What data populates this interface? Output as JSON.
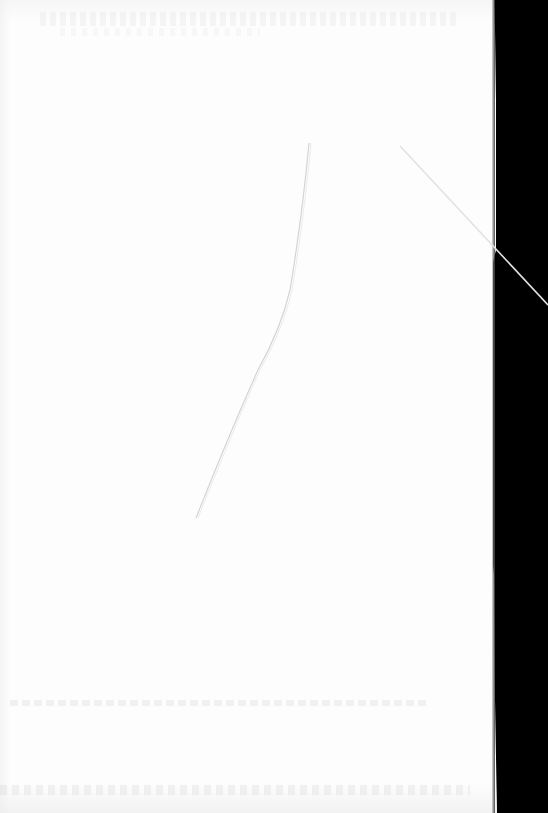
{
  "document": {
    "type": "blank scanned page",
    "text_content": "",
    "colors": {
      "paper": "#fdfdfd",
      "scanner_background": "#000000",
      "fiber_line": "#d9d9d9",
      "diagonal_line": "#e0e0e0"
    },
    "artifacts": [
      {
        "name": "hair-fiber",
        "description": "thin curved fiber from top-center to lower-left"
      },
      {
        "name": "diagonal-crease",
        "description": "thin diagonal line crossing the right page edge near top"
      },
      {
        "name": "page-edge",
        "description": "black scanner bed visible along right edge"
      },
      {
        "name": "bleed-through",
        "description": "faint illegible show-through text near top and bottom"
      }
    ]
  }
}
